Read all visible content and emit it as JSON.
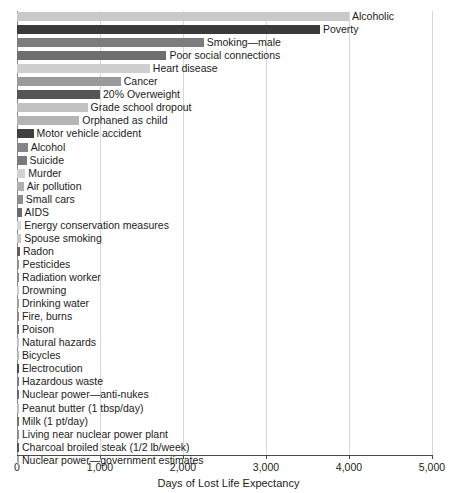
{
  "chart_data": {
    "type": "bar",
    "orientation": "horizontal",
    "title": "",
    "xlabel": "Days of Lost Life Expectancy",
    "ylabel": "",
    "xlim": [
      0,
      5000
    ],
    "xticks": [
      0,
      1000,
      2000,
      3000,
      4000,
      5000
    ],
    "xtick_labels": [
      "0",
      "1,000",
      "2,000",
      "3,000",
      "4,000",
      "5,000"
    ],
    "grid": true,
    "grid_axis": "x",
    "legend": "none",
    "categories": [
      "Alcoholic",
      "Poverty",
      "Smoking—male",
      "Poor social connections",
      "Heart disease",
      "Cancer",
      "20% Overweight",
      "Grade school dropout",
      "Orphaned as child",
      "Motor vehicle accident",
      "Alcohol",
      "Suicide",
      "Murder",
      "Air pollution",
      "Small cars",
      "AIDS",
      "Energy conservation measures",
      "Spouse smoking",
      "Radon",
      "Pesticides",
      "Radiation worker",
      "Drowning",
      "Drinking water",
      "Fire, burns",
      "Poison",
      "Natural hazards",
      "Bicycles",
      "Electrocution",
      "Hazardous waste",
      "Nuclear power—anti-nukes",
      "Peanut butter (1 tbsp/day)",
      "Milk (1 pt/day)",
      "Living near nuclear power plant",
      "Charcoal broiled steak (1/2 lb/week)",
      "Nuclear power—government estimates"
    ],
    "values": [
      4000,
      3650,
      2250,
      1800,
      1600,
      1250,
      1000,
      850,
      750,
      200,
      130,
      115,
      100,
      80,
      70,
      55,
      50,
      50,
      35,
      30,
      25,
      24,
      20,
      20,
      18,
      12,
      10,
      6,
      4,
      3,
      2,
      2,
      2,
      2,
      1
    ],
    "bar_colors": [
      "#c9c9c9",
      "#3a3a3a",
      "#7d7d7d",
      "#6e6e6e",
      "#cfcfcf",
      "#9a9a9a",
      "#555555",
      "#c2c2c2",
      "#b5b5b5",
      "#3f3f3f",
      "#858585",
      "#7a7a7a",
      "#d2d2d2",
      "#b0b0b0",
      "#8d8d8d",
      "#6a6a6a",
      "#d6d6d6",
      "#c8c8c8",
      "#5e5e5e",
      "#8f8f8f",
      "#8a8a8a",
      "#cfcfcf",
      "#9e9e9e",
      "#8a8a8a",
      "#707070",
      "#c4c4c4",
      "#b9b9b9",
      "#4a4a4a",
      "#7e7e7e",
      "#6a6a6a",
      "#c0c0c0",
      "#707070",
      "#8f8f8f",
      "#555555",
      "#a8a8a8"
    ]
  }
}
